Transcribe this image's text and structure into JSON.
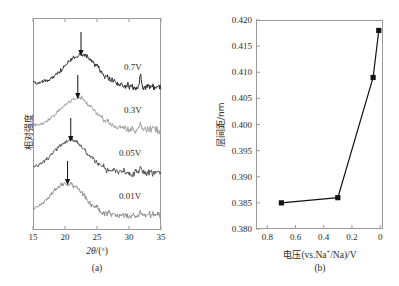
{
  "figure": {
    "panels": [
      {
        "id": "a",
        "caption": "(a)",
        "xlabel_math": "2θ/(°)",
        "ylabel": "相对强度"
      },
      {
        "id": "b",
        "caption": "(b)",
        "xlabel": "电压(vs.Na+/Na)/V",
        "ylabel": "层间距/nm"
      }
    ]
  },
  "chart_data": [
    {
      "type": "line",
      "panel": "a",
      "title": "",
      "xlabel": "2θ/(°)",
      "ylabel": "相对强度",
      "xlim": [
        15,
        35
      ],
      "xticks": [
        15,
        20,
        25,
        30,
        35
      ],
      "xtick_labels": [
        "15",
        "20",
        "25",
        "30",
        "35"
      ],
      "yticks": [],
      "ytick_labels": [],
      "grid": false,
      "legend": "inline-right-of-curve",
      "note": "Ex-situ XRD patterns stacked with vertical offset; arrows mark the broad (002) peak position which shifts to lower 2-theta as voltage decreases.",
      "series": [
        {
          "name": "0.7V",
          "label": "0.7V",
          "color": "#2f2f2f",
          "offset_index": 0,
          "peak_2theta": 22.5,
          "arrow_2theta": 22.5
        },
        {
          "name": "0.3V",
          "label": "0.3V",
          "color": "#a3a3a3",
          "offset_index": 1,
          "peak_2theta": 22.0,
          "arrow_2theta": 22.0
        },
        {
          "name": "0.05V",
          "label": "0.05V",
          "color": "#555555",
          "offset_index": 2,
          "peak_2theta": 20.9,
          "arrow_2theta": 20.9
        },
        {
          "name": "0.01V",
          "label": "0.01V",
          "color": "#8e8e8e",
          "offset_index": 3,
          "peak_2theta": 20.4,
          "arrow_2theta": 20.4
        }
      ]
    },
    {
      "type": "line",
      "panel": "b",
      "title": "",
      "xlabel": "电压(vs.Na+/Na)/V",
      "ylabel": "层间距/nm",
      "xlim": [
        0.88,
        -0.02
      ],
      "xticks": [
        0.8,
        0.6,
        0.4,
        0.2,
        0
      ],
      "xtick_labels": [
        "0.8",
        "0.6",
        "0.4",
        "0.2",
        "0"
      ],
      "ylim": [
        0.38,
        0.42
      ],
      "yticks": [
        0.38,
        0.385,
        0.39,
        0.395,
        0.4,
        0.405,
        0.41,
        0.415,
        0.42
      ],
      "ytick_labels": [
        "0.380",
        "0.385",
        "0.390",
        "0.395",
        "0.400",
        "0.405",
        "0.410",
        "0.415",
        "0.420"
      ],
      "grid": false,
      "marker": "filled-square",
      "color": "#111111",
      "x": [
        0.7,
        0.3,
        0.05,
        0.01
      ],
      "y": [
        0.385,
        0.386,
        0.409,
        0.418
      ],
      "points": [
        {
          "x": 0.7,
          "y": 0.385
        },
        {
          "x": 0.3,
          "y": 0.386
        },
        {
          "x": 0.05,
          "y": 0.409
        },
        {
          "x": 0.01,
          "y": 0.418
        }
      ]
    }
  ]
}
